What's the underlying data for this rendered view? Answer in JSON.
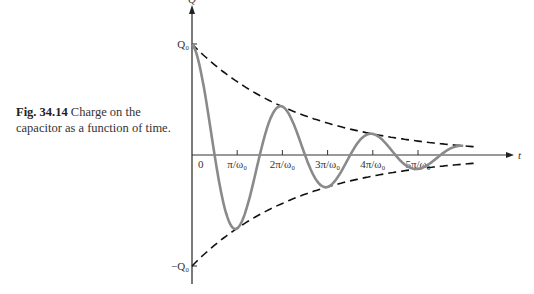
{
  "caption": {
    "figure_number": "Fig. 34.14",
    "text": "Charge on the capacitor as a function of time.",
    "line1_rest": "Charge on the",
    "line2": "capacitor as a function of time."
  },
  "chart_data": {
    "type": "line",
    "title": "Charge on the capacitor as a function of time.",
    "xlabel": "t",
    "ylabel": "Q",
    "x_ticks": [
      "0",
      "π/ω0",
      "2π/ω0",
      "3π/ω0",
      "4π/ω0",
      "5π/ω0"
    ],
    "y_ticks": [
      "Q0",
      "−Q0"
    ],
    "grid": false,
    "legend": null,
    "series": [
      {
        "name": "Q(t) damped oscillation",
        "style": "solid gray",
        "x_units_pi_over_omega0": [
          0,
          1,
          2,
          3,
          4,
          5
        ],
        "values_over_Q0": [
          1.0,
          -0.66,
          0.43,
          -0.29,
          0.19,
          -0.12
        ]
      },
      {
        "name": "upper envelope Q0·e^(−γt)",
        "style": "dashed black",
        "x_units_pi_over_omega0": [
          0,
          1,
          2,
          3,
          4,
          5,
          6
        ],
        "values_over_Q0": [
          1.0,
          0.66,
          0.43,
          0.29,
          0.19,
          0.12,
          0.08
        ]
      },
      {
        "name": "lower envelope −Q0·e^(−γt)",
        "style": "dashed black",
        "x_units_pi_over_omega0": [
          0,
          1,
          2,
          3,
          4,
          5,
          6
        ],
        "values_over_Q0": [
          -1.0,
          -0.66,
          -0.43,
          -0.29,
          -0.19,
          -0.12,
          -0.08
        ]
      }
    ],
    "axis_labels": {
      "y_top": "Q0",
      "y_bottom": "−Q0",
      "origin": "0",
      "t_axis": "t"
    }
  }
}
